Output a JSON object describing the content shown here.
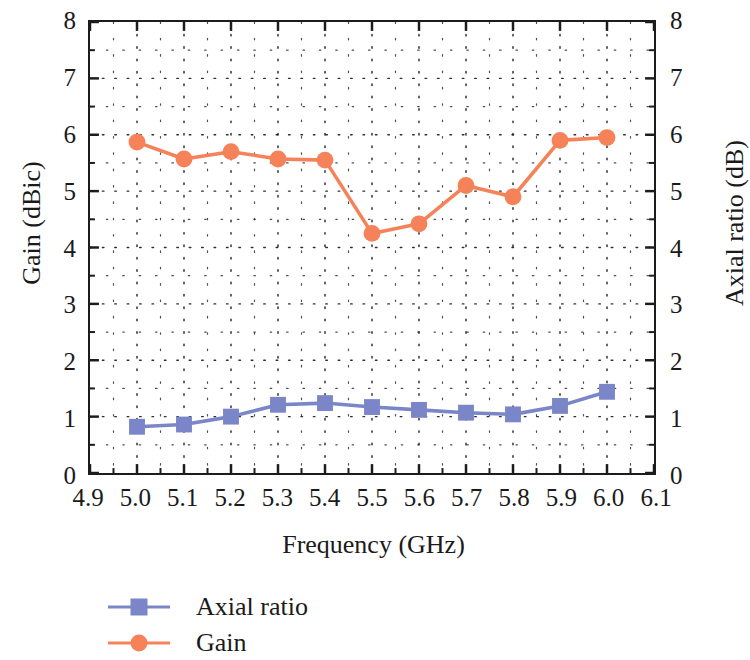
{
  "chart_data": {
    "type": "line",
    "title": "",
    "xlabel": "Frequency (GHz)",
    "ylabel": "Gain (dBic)",
    "ylabel_right": "Axial ratio (dB)",
    "xlim": [
      4.9,
      6.1
    ],
    "ylim": [
      0,
      8
    ],
    "ylim_right": [
      0,
      8
    ],
    "grid": true,
    "grid_style": "dotted",
    "legend_position": "below-left",
    "xticks": [
      "4.9",
      "5.0",
      "5.1",
      "5.2",
      "5.3",
      "5.4",
      "5.5",
      "5.6",
      "5.7",
      "5.8",
      "5.9",
      "6.0",
      "6.1"
    ],
    "xtick_values": [
      4.9,
      5.0,
      5.1,
      5.2,
      5.3,
      5.4,
      5.5,
      5.6,
      5.7,
      5.8,
      5.9,
      6.0,
      6.1
    ],
    "yticks": [
      "0",
      "1",
      "2",
      "3",
      "4",
      "5",
      "6",
      "7",
      "8"
    ],
    "ytick_values": [
      0,
      1,
      2,
      3,
      4,
      5,
      6,
      7,
      8
    ],
    "yticks_right": [
      "0",
      "1",
      "2",
      "3",
      "4",
      "5",
      "6",
      "7",
      "8"
    ],
    "ytick_values_right": [
      0,
      1,
      2,
      3,
      4,
      5,
      6,
      7,
      8
    ],
    "x": [
      5.0,
      5.1,
      5.2,
      5.3,
      5.4,
      5.5,
      5.6,
      5.7,
      5.8,
      5.9,
      6.0
    ],
    "series": [
      {
        "name": "Axial ratio",
        "axis": "right",
        "color": "#7b86c8",
        "marker": "square",
        "values": [
          0.82,
          0.86,
          1.0,
          1.21,
          1.24,
          1.17,
          1.12,
          1.07,
          1.04,
          1.19,
          1.44
        ]
      },
      {
        "name": "Gain",
        "axis": "left",
        "color": "#f58258",
        "marker": "circle",
        "values": [
          5.87,
          5.57,
          5.7,
          5.57,
          5.55,
          4.25,
          4.42,
          5.1,
          4.9,
          5.9,
          5.95
        ]
      }
    ]
  },
  "legend": {
    "items": [
      {
        "label": "Axial ratio",
        "color": "#7b86c8",
        "marker": "square"
      },
      {
        "label": "Gain",
        "color": "#f58258",
        "marker": "circle"
      }
    ]
  },
  "colors": {
    "axial_ratio": "#7b86c8",
    "gain": "#f58258",
    "axis": "#1c1c1c",
    "grid": "#222222",
    "background": "#ffffff"
  }
}
